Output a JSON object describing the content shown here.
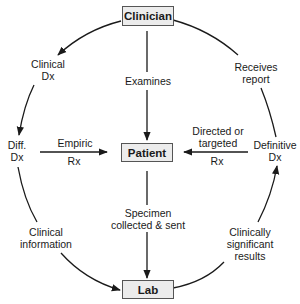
{
  "nodes": {
    "clinician": "Clinician",
    "patient": "Patient",
    "lab": "Lab"
  },
  "labels": {
    "clinical_dx": "Clinical\nDx",
    "examines": "Examines",
    "receives_report": "Receives\nreport",
    "diff_dx": "Diff.\nDx",
    "empiric": "Empiric",
    "rx_left": "Rx",
    "directed": "Directed or\ntargeted",
    "rx_right": "Rx",
    "definitive_dx": "Definitive\nDx",
    "specimen": "Specimen\ncollected & sent",
    "clinical_information": "Clinical\ninformation",
    "clinically_significant": "Clinically\nsignificant\nresults"
  },
  "colors": {
    "box_fill": "#ececec",
    "box_border": "#555555",
    "line": "#1a1a1a"
  }
}
